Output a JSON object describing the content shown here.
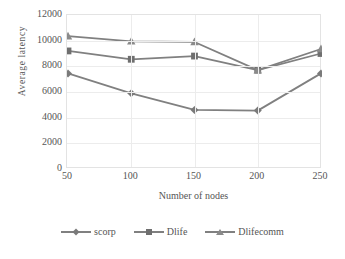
{
  "chart_data": {
    "type": "line",
    "title": "",
    "xlabel": "Number of nodes",
    "ylabel": "Average  latency",
    "categories": [
      "50",
      "100",
      "150",
      "200",
      "250"
    ],
    "x": [
      50,
      100,
      150,
      200,
      250
    ],
    "ylim": [
      0,
      12000
    ],
    "yticks": [
      0,
      2000,
      4000,
      6000,
      8000,
      10000,
      12000
    ],
    "ytick_labels": [
      "0",
      "2000",
      "4000",
      "6000",
      "8000",
      "10000",
      "12000"
    ],
    "grid": "horizontal-and-vertical",
    "legend_position": "bottom",
    "series": [
      {
        "name": "scorp",
        "marker": "diamond",
        "color": "#7a7a7a",
        "values": [
          7450,
          5900,
          4600,
          4550,
          7450
        ]
      },
      {
        "name": "Dlife",
        "marker": "square",
        "color": "#6f6f6f",
        "values": [
          9200,
          8550,
          8800,
          7700,
          9000
        ]
      },
      {
        "name": "Dlifecomm",
        "marker": "triangle",
        "color": "#8a8a8a",
        "values": [
          10350,
          9950,
          9900,
          7700,
          9350
        ]
      }
    ]
  },
  "style": {
    "line_color": "#808080",
    "grid_color": "#ececec",
    "border_color": "#e3e3e3",
    "text_color": "#555555",
    "background": "#ffffff"
  },
  "legend": {
    "items": [
      {
        "label": "scorp",
        "marker": "diamond"
      },
      {
        "label": "Dlife",
        "marker": "square"
      },
      {
        "label": "Dlifecomm",
        "marker": "triangle"
      }
    ]
  }
}
